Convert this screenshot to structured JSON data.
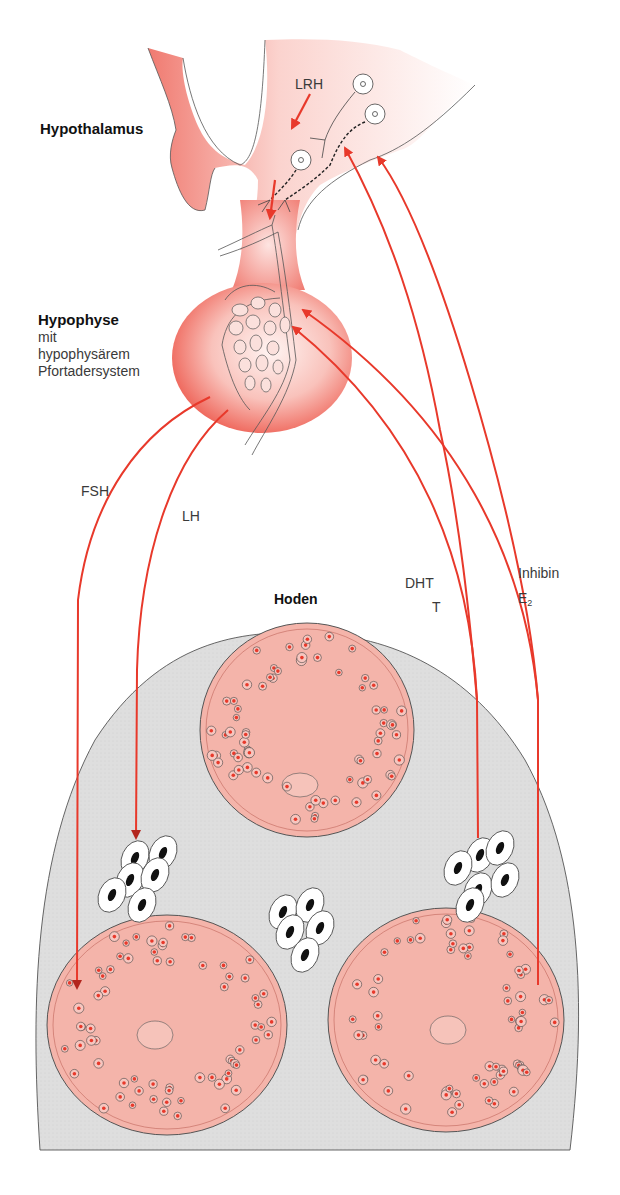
{
  "labels": {
    "hypothalamus": "Hypothalamus",
    "lrh": "LRH",
    "hypophyse": "Hypophyse",
    "hypophyse_sub1": "mit",
    "hypophyse_sub2": "hypophysärem",
    "hypophyse_sub3": "Pfortadersystem",
    "fsh": "FSH",
    "lh": "LH",
    "hoden": "Hoden",
    "dht": "DHT",
    "t": "T",
    "inhibin": "Inhibin",
    "e2_base": "E",
    "e2_sub": "2"
  },
  "colors": {
    "arrow": "#e8392b",
    "arrow_dark": "#b3261e",
    "gland": "#f07a70",
    "gland_light": "#fde4e1",
    "tubule": "#f4b4aa",
    "tissue": "#dcdcdc",
    "outline": "#333333"
  },
  "pathways": [
    {
      "from": "Hypothalamus",
      "to": "Hypophyse",
      "hormone": "LRH"
    },
    {
      "from": "Hypophyse",
      "to": "Samenkanälchen",
      "hormone": "FSH"
    },
    {
      "from": "Hypophyse",
      "to": "Leydig-Zellen",
      "hormone": "LH"
    },
    {
      "from": "Leydig-Zellen",
      "to": "Hypophyse / Hypothalamus",
      "hormone": "DHT, T"
    },
    {
      "from": "Samenkanälchen",
      "to": "Hypophyse / Hypothalamus",
      "hormone": "Inhibin, E2"
    }
  ]
}
